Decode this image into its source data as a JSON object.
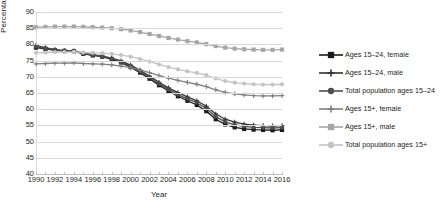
{
  "chart_data": {
    "type": "line",
    "title": "",
    "xlabel": "Year",
    "ylabel": "Percentage",
    "ylim": [
      40,
      90
    ],
    "ytick_labels": [
      "90",
      "85",
      "80",
      "75",
      "70",
      "65",
      "60",
      "55",
      "50",
      "45",
      "40"
    ],
    "yticks": [
      90,
      85,
      80,
      75,
      70,
      65,
      60,
      55,
      50,
      45,
      40
    ],
    "grid": true,
    "legend_position": "right",
    "x": [
      1990,
      1991,
      1992,
      1993,
      1994,
      1995,
      1996,
      1997,
      1998,
      1999,
      2000,
      2001,
      2002,
      2003,
      2004,
      2005,
      2006,
      2007,
      2008,
      2009,
      2010,
      2011,
      2012,
      2013,
      2014,
      2015,
      2016
    ],
    "xtick_labels": [
      "1990",
      "1992",
      "1994",
      "1996",
      "1998",
      "2000",
      "2002",
      "2004",
      "2006",
      "2008",
      "2010",
      "2012",
      "2014",
      "2016"
    ],
    "xticks": [
      1990,
      1992,
      1994,
      1996,
      1998,
      2000,
      2002,
      2004,
      2006,
      2008,
      2010,
      2012,
      2014,
      2016
    ],
    "series": [
      {
        "name": "Ages 15–24, female",
        "marker": "square",
        "color": "#1a1a1a",
        "values": [
          79.0,
          78.6,
          78.2,
          78.0,
          77.9,
          77.1,
          76.6,
          76.2,
          75.4,
          74.4,
          73.0,
          71.3,
          69.4,
          67.4,
          65.6,
          64.0,
          62.6,
          61.3,
          59.4,
          56.9,
          55.3,
          54.4,
          53.9,
          53.7,
          53.6,
          53.5,
          53.6
        ]
      },
      {
        "name": "Ages 15–24, male",
        "marker": "plus",
        "color": "#333333",
        "values": [
          79.6,
          79.0,
          78.4,
          78.1,
          78.0,
          77.3,
          76.8,
          76.4,
          75.8,
          74.9,
          73.6,
          72.0,
          70.2,
          68.3,
          66.6,
          65.1,
          63.8,
          62.6,
          60.9,
          58.5,
          56.9,
          56.0,
          55.4,
          55.1,
          54.9,
          54.8,
          54.9
        ]
      },
      {
        "name": "Total population ages 15–24",
        "marker": "circle",
        "color": "#4d4d4d",
        "values": [
          79.3,
          78.8,
          78.3,
          78.0,
          77.9,
          77.2,
          76.7,
          76.3,
          75.6,
          74.6,
          73.3,
          71.6,
          69.8,
          67.8,
          66.1,
          64.5,
          63.2,
          62.0,
          60.2,
          57.7,
          56.1,
          55.2,
          54.7,
          54.4,
          54.3,
          54.2,
          54.3
        ]
      },
      {
        "name": "Ages 15+, female",
        "marker": "plus",
        "color": "#808080",
        "values": [
          74.0,
          74.1,
          74.2,
          74.2,
          74.3,
          74.1,
          74.0,
          73.9,
          73.7,
          73.3,
          72.8,
          72.1,
          71.3,
          70.4,
          69.6,
          68.9,
          68.3,
          67.7,
          67.0,
          66.0,
          65.2,
          64.7,
          64.4,
          64.2,
          64.1,
          64.1,
          64.2
        ]
      },
      {
        "name": "Ages 15+, male",
        "marker": "square",
        "color": "#a6a6a6",
        "values": [
          85.3,
          85.4,
          85.5,
          85.5,
          85.5,
          85.4,
          85.3,
          85.2,
          85.0,
          84.7,
          84.3,
          83.8,
          83.2,
          82.6,
          82.0,
          81.5,
          81.0,
          80.6,
          80.1,
          79.5,
          79.0,
          78.7,
          78.5,
          78.4,
          78.3,
          78.3,
          78.4
        ]
      },
      {
        "name": "Total population ages 15+",
        "marker": "circle",
        "color": "#c4c4c4",
        "values": [
          77.4,
          77.5,
          77.6,
          77.6,
          77.7,
          77.5,
          77.4,
          77.3,
          77.1,
          76.7,
          76.2,
          75.5,
          74.7,
          73.8,
          73.0,
          72.3,
          71.7,
          71.2,
          70.5,
          69.5,
          68.7,
          68.2,
          67.9,
          67.7,
          67.6,
          67.6,
          67.7
        ]
      }
    ]
  }
}
